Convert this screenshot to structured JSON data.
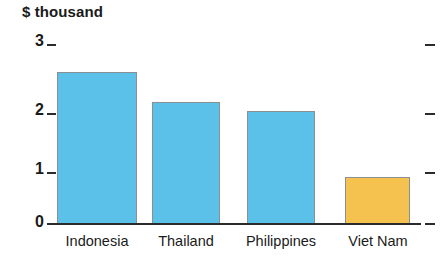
{
  "chart_data": {
    "type": "bar",
    "title": "$ thousand",
    "xlabel": "",
    "ylabel": "$ thousand",
    "categories": [
      "Indonesia",
      "Thailand",
      "Philippines",
      "Viet Nam"
    ],
    "values": [
      2.55,
      2.05,
      1.9,
      0.78
    ],
    "ylim": [
      0,
      3
    ],
    "yticks": [
      0,
      1,
      2,
      3
    ],
    "ytick_labels": [
      "0",
      "1",
      "2",
      "3"
    ],
    "grid": false,
    "legend": null,
    "bar_colors": [
      "#5cc1e8",
      "#5cc1e8",
      "#5cc1e8",
      "#f6c24f"
    ],
    "series": [
      {
        "name": "$ thousand",
        "values": [
          2.55,
          2.05,
          1.9,
          0.78
        ]
      }
    ],
    "axis_color": "#2b2b2b",
    "bar_border_color": "#8a8f92",
    "right_axis_ticks": [
      0,
      1,
      2,
      3
    ]
  }
}
